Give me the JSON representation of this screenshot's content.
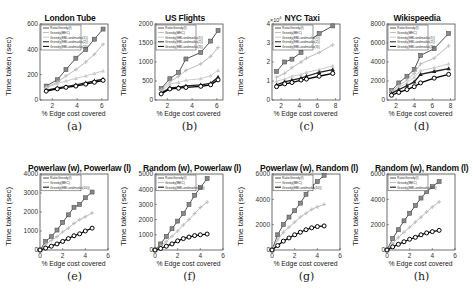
{
  "figure": {
    "panels": [
      {
        "id": "a",
        "caption": "(a)",
        "title": "London Tube",
        "xlabel": "% Edge cost covered",
        "ylabel": "Time taken (sec)",
        "yticks": [
          "0",
          "200",
          "400",
          "600"
        ],
        "xticks": [
          "2",
          "4",
          "6"
        ]
      },
      {
        "id": "b",
        "caption": "(b)",
        "title": "US Flights",
        "xlabel": "% Edge cost covered",
        "ylabel": "Time taken (sec)",
        "yticks": [
          "0",
          "500",
          "1000",
          "1500",
          "2000"
        ],
        "xticks": [
          "2",
          "4",
          "6"
        ]
      },
      {
        "id": "c",
        "caption": "(c)",
        "title": "NYC Taxi",
        "xlabel": "% Edge cost covered",
        "ylabel": "Time taken (sec)",
        "yticks": [
          "0",
          "1",
          "2",
          "3",
          "4"
        ],
        "xticks": [
          "2",
          "4",
          "6",
          "8"
        ],
        "yscale_note": "× 10^4"
      },
      {
        "id": "d",
        "caption": "(d)",
        "title": "Wikispeedia",
        "xlabel": "% Edge cost covered",
        "ylabel": "Time taken (sec)",
        "yticks": [
          "0",
          "2000",
          "4000",
          "6000",
          "8000"
        ],
        "xticks": [
          "2",
          "4",
          "6",
          "8"
        ]
      },
      {
        "id": "e",
        "caption": "(e)",
        "title": "Powerlaw (w), Powerlaw (l)",
        "xlabel": "% Edge cost covered",
        "ylabel": "Time taken (sec)",
        "yticks": [
          "0",
          "1000",
          "2000",
          "3000",
          "4000"
        ],
        "xticks": [
          "0",
          "2",
          "4",
          "6"
        ]
      },
      {
        "id": "f",
        "caption": "(f)",
        "title": "Random (w), Powerlaw (l)",
        "xlabel": "% Edge cost covered",
        "ylabel": "Time taken (sec)",
        "yticks": [
          "0",
          "1000",
          "2000",
          "3000",
          "4000",
          "5000"
        ],
        "xticks": [
          "0",
          "2",
          "4",
          "6"
        ]
      },
      {
        "id": "g",
        "caption": "(g)",
        "title": "Powerlaw (w), Random (l)",
        "xlabel": "% Edge cost covered",
        "ylabel": "Time taken (sec)",
        "yticks": [
          "0",
          "2000",
          "4000",
          "6000"
        ],
        "xticks": [
          "0",
          "2",
          "4",
          "6"
        ]
      },
      {
        "id": "h",
        "caption": "(h)",
        "title": "Random (w), Random (l)",
        "xlabel": "% Edge cost covered",
        "ylabel": "Time taken (sec)",
        "yticks": [
          "0",
          "2000",
          "4000",
          "6000"
        ],
        "xticks": [
          "0",
          "2",
          "4",
          "6"
        ]
      }
    ]
  },
  "chart_data": [
    {
      "type": "line",
      "title": "London Tube",
      "xlabel": "% Edge cost covered",
      "ylabel": "Time taken (sec)",
      "xlim": [
        1,
        6.5
      ],
      "ylim": [
        0,
        600
      ],
      "legend_position": "upper left",
      "x": [
        1.5,
        2.4,
        3.1,
        3.9,
        4.7,
        5.4,
        6.1
      ],
      "series": [
        {
          "name": "RatioGreedy(f)",
          "color": "#555555",
          "marker": "square",
          "values": [
            110,
            160,
            240,
            330,
            400,
            480,
            560
          ]
        },
        {
          "name": "Greedy(BEC)",
          "color": "#bbbbbb",
          "marker": "plus",
          "values": [
            100,
            140,
            190,
            240,
            300,
            360,
            440
          ]
        },
        {
          "name": "Greedy(EBLandmarks(1))",
          "color": "#cccccc",
          "marker": "triangle",
          "values": [
            95,
            130,
            150,
            170,
            190,
            210,
            230
          ]
        },
        {
          "name": "Greedy(EBLandmarks(2))",
          "color": "#222222",
          "marker": "star",
          "values": [
            75,
            95,
            105,
            120,
            135,
            150,
            165
          ]
        },
        {
          "name": "Greedy(EBLandmarks(3))",
          "color": "#000000",
          "marker": "circle",
          "values": [
            70,
            88,
            100,
            110,
            125,
            140,
            155
          ]
        }
      ]
    },
    {
      "type": "line",
      "title": "US Flights",
      "xlabel": "% Edge cost covered",
      "ylabel": "Time taken (sec)",
      "xlim": [
        1,
        6.5
      ],
      "ylim": [
        0,
        2000
      ],
      "legend_position": "upper left",
      "x": [
        1.5,
        2.2,
        2.9,
        3.5,
        4.7,
        5.5,
        6.1
      ],
      "series": [
        {
          "name": "RatioGreedy(f)",
          "color": "#555555",
          "marker": "square",
          "values": [
            300,
            560,
            720,
            1080,
            1250,
            1550,
            1830
          ]
        },
        {
          "name": "Greedy(BEC)",
          "color": "#bbbbbb",
          "marker": "plus",
          "values": [
            260,
            480,
            620,
            780,
            950,
            1150,
            1380
          ]
        },
        {
          "name": "Greedy(EBLandmarks(1))",
          "color": "#cccccc",
          "marker": "triangle",
          "values": [
            220,
            420,
            460,
            520,
            560,
            640,
            780
          ]
        },
        {
          "name": "Greedy(EBLandmarks(2))",
          "color": "#222222",
          "marker": "star",
          "values": [
            180,
            320,
            340,
            370,
            400,
            440,
            600
          ]
        },
        {
          "name": "Greedy(EBLandmarks(3))",
          "color": "#000000",
          "marker": "circle",
          "values": [
            160,
            290,
            310,
            330,
            360,
            400,
            530
          ]
        }
      ]
    },
    {
      "type": "line",
      "title": "NYC Taxi",
      "xlabel": "% Edge cost covered",
      "ylabel": "Time taken (sec)",
      "xlim": [
        1,
        8.5
      ],
      "ylim": [
        0,
        40000
      ],
      "y_multiplier": "x10^4",
      "legend_position": "upper left",
      "x": [
        1.5,
        2.4,
        3.2,
        4.2,
        4.8,
        6.2,
        7.7
      ],
      "series": [
        {
          "name": "RatioGreedy(f)",
          "color": "#555555",
          "marker": "square",
          "values": [
            15000,
            20000,
            21500,
            25000,
            30000,
            35000,
            39000
          ]
        },
        {
          "name": "Greedy(BEC)",
          "color": "#bbbbbb",
          "marker": "plus",
          "values": [
            12000,
            14000,
            17000,
            20000,
            22000,
            25000,
            29000
          ]
        },
        {
          "name": "Greedy(EBLandmarks(1))",
          "color": "#cccccc",
          "marker": "triangle",
          "values": [
            10000,
            11000,
            12500,
            13500,
            14500,
            16000,
            18000
          ]
        },
        {
          "name": "Greedy(EBLandmarks(2))",
          "color": "#222222",
          "marker": "star",
          "values": [
            8000,
            9500,
            10500,
            11500,
            12500,
            14500,
            16000
          ]
        },
        {
          "name": "Greedy(EBLandmarks(3))",
          "color": "#000000",
          "marker": "circle",
          "values": [
            7000,
            8500,
            9200,
            10500,
            11000,
            12500,
            14000
          ]
        }
      ]
    },
    {
      "type": "line",
      "title": "Wikispeedia",
      "xlabel": "% Edge cost covered",
      "ylabel": "Time taken (sec)",
      "xlim": [
        1,
        8.5
      ],
      "ylim": [
        0,
        8000
      ],
      "legend_position": "upper left",
      "x": [
        1.5,
        2.3,
        3.2,
        4.0,
        4.7,
        6.2,
        7.8
      ],
      "series": [
        {
          "name": "RatioGreedy(f)",
          "color": "#555555",
          "marker": "square",
          "values": [
            1000,
            1800,
            2500,
            3200,
            4700,
            5400,
            7000
          ]
        },
        {
          "name": "Greedy(BEC)",
          "color": "#bbbbbb",
          "marker": "plus",
          "values": [
            900,
            1500,
            2100,
            2800,
            3800,
            4400,
            5700
          ]
        },
        {
          "name": "Greedy(EBLandmarks(1))",
          "color": "#cccccc",
          "marker": "triangle",
          "values": [
            800,
            1300,
            1800,
            2400,
            3100,
            3400,
            3800
          ]
        },
        {
          "name": "Greedy(EBLandmarks(2))",
          "color": "#222222",
          "marker": "star",
          "values": [
            700,
            1100,
            1500,
            1900,
            2700,
            3000,
            3300
          ]
        },
        {
          "name": "Greedy(EBLandmarks(3))",
          "color": "#000000",
          "marker": "circle",
          "values": [
            500,
            800,
            1100,
            1400,
            1800,
            2300,
            2700
          ]
        }
      ]
    },
    {
      "type": "line",
      "title": "Powerlaw (w), Powerlaw (l)",
      "xlabel": "% Edge cost covered",
      "ylabel": "Time taken (sec)",
      "xlim": [
        0,
        6
      ],
      "ylim": [
        0,
        4000
      ],
      "legend_position": "upper left",
      "x": [
        0,
        0.5,
        1,
        1.5,
        2,
        2.5,
        3,
        3.5,
        4,
        4.6
      ],
      "series": [
        {
          "name": "RatioGreedy(f)",
          "color": "#555555",
          "marker": "square",
          "values": [
            0,
            450,
            700,
            1050,
            1450,
            1850,
            2250,
            2400,
            2750,
            3050
          ]
        },
        {
          "name": "Greedy(BEC)",
          "color": "#bbbbbb",
          "marker": "plus",
          "values": [
            0,
            300,
            500,
            700,
            950,
            1150,
            1400,
            1600,
            1750,
            1950
          ]
        },
        {
          "name": "Greedy(EBLandmarks(10))",
          "color": "#000000",
          "marker": "circle",
          "values": [
            0,
            100,
            200,
            320,
            450,
            600,
            750,
            850,
            1000,
            1150
          ]
        }
      ]
    },
    {
      "type": "line",
      "title": "Random (w), Powerlaw (l)",
      "xlabel": "% Edge cost covered",
      "ylabel": "Time taken (sec)",
      "xlim": [
        0,
        6
      ],
      "ylim": [
        0,
        5000
      ],
      "legend_position": "upper left",
      "x": [
        0,
        0.5,
        1,
        1.5,
        2,
        2.5,
        3,
        3.5,
        4,
        4.6
      ],
      "series": [
        {
          "name": "RatioGreedy(f)",
          "color": "#555555",
          "marker": "square",
          "values": [
            0,
            400,
            900,
            1400,
            1900,
            2400,
            3000,
            3600,
            4100,
            4700
          ]
        },
        {
          "name": "Greedy(BEC)",
          "color": "#bbbbbb",
          "marker": "plus",
          "values": [
            0,
            250,
            550,
            900,
            1250,
            1650,
            2000,
            2400,
            2800,
            3150
          ]
        },
        {
          "name": "Greedy(EBLandmarks(10))",
          "color": "#000000",
          "marker": "circle",
          "values": [
            0,
            100,
            250,
            400,
            600,
            750,
            850,
            950,
            1000,
            1050
          ]
        }
      ]
    },
    {
      "type": "line",
      "title": "Powerlaw (w), Random (l)",
      "xlabel": "% Edge cost covered",
      "ylabel": "Time taken (sec)",
      "xlim": [
        0,
        6
      ],
      "ylim": [
        0,
        6000
      ],
      "legend_position": "upper left",
      "x": [
        0,
        0.5,
        1,
        1.5,
        2,
        2.5,
        3,
        3.5,
        4,
        4.6
      ],
      "series": [
        {
          "name": "RatioGreedy(f)",
          "color": "#555555",
          "marker": "square",
          "values": [
            0,
            1200,
            2000,
            2600,
            3100,
            3700,
            4400,
            5000,
            5400,
            5900
          ]
        },
        {
          "name": "Greedy(BEC)",
          "color": "#bbbbbb",
          "marker": "plus",
          "values": [
            0,
            800,
            1400,
            1800,
            2200,
            2600,
            2900,
            3200,
            3400,
            3600
          ]
        },
        {
          "name": "Greedy(EBLandmarks(10))",
          "color": "#000000",
          "marker": "circle",
          "values": [
            0,
            350,
            700,
            950,
            1200,
            1400,
            1600,
            1750,
            1850,
            1900
          ]
        }
      ]
    },
    {
      "type": "line",
      "title": "Random (w), Random (l)",
      "xlabel": "% Edge cost covered",
      "ylabel": "Time taken (sec)",
      "xlim": [
        0,
        6
      ],
      "ylim": [
        0,
        6000
      ],
      "legend_position": "upper left",
      "x": [
        0,
        0.5,
        1,
        1.5,
        2,
        2.5,
        3,
        3.5,
        4,
        4.6
      ],
      "series": [
        {
          "name": "RatioGreedy(f)",
          "color": "#555555",
          "marker": "square",
          "values": [
            0,
            900,
            1600,
            2300,
            2900,
            3500,
            4100,
            4600,
            5000,
            5400
          ]
        },
        {
          "name": "Greedy(BEC)",
          "color": "#bbbbbb",
          "marker": "plus",
          "values": [
            0,
            500,
            1000,
            1400,
            1800,
            2200,
            2600,
            3000,
            3400,
            3800
          ]
        },
        {
          "name": "Greedy(EBLandmarks(10))",
          "color": "#000000",
          "marker": "circle",
          "values": [
            0,
            250,
            450,
            650,
            850,
            1000,
            1200,
            1350,
            1450,
            1550
          ]
        }
      ]
    }
  ]
}
